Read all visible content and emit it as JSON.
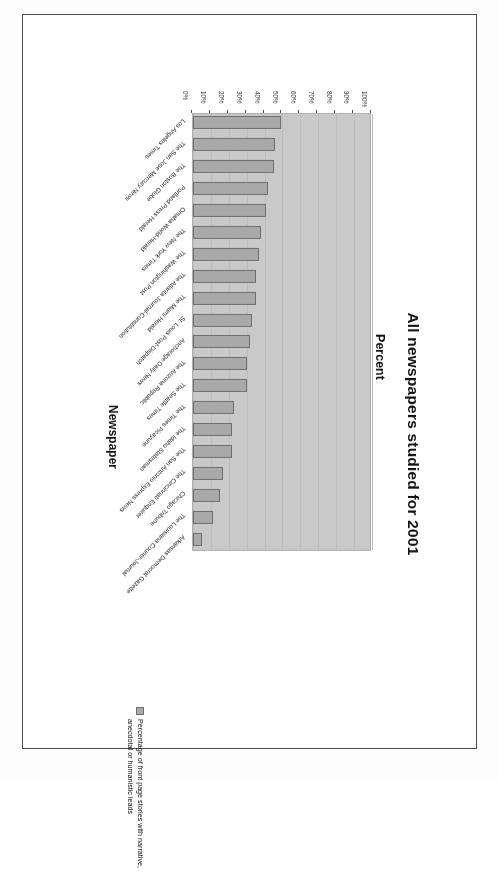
{
  "document": {
    "kind": "scanned-slide",
    "orientation_note": "chart printed upside-down on the page"
  },
  "chart_data": {
    "type": "bar",
    "orientation": "vertical",
    "title": "All newspapers studied for 2001",
    "xlabel": "Newspaper",
    "ylabel": "Percent",
    "ylim": [
      0,
      100
    ],
    "grid": true,
    "legend_position": "right",
    "legend": [
      "Percentage of front page stories with narrative, anecdotal or humanistic leads"
    ],
    "ytick_labels": [
      "100%",
      "90%",
      "80%",
      "70%",
      "60%",
      "50%",
      "40%",
      "30%",
      "20%",
      "10%",
      "0%"
    ],
    "ytick_values": [
      100,
      90,
      80,
      70,
      60,
      50,
      40,
      30,
      20,
      10,
      0
    ],
    "categories": [
      "Arkansas Democrat Gazette",
      "The Louisiana Courier-Journal",
      "Chicago Tribune",
      "The Cincinnati Enquirer",
      "The San Antonio Express News",
      "The Idaho Statesman",
      "The Times Picayune",
      "The Seattle Times",
      "The Arizona Republic",
      "Anchorage Daily News",
      "St. Louis Post-Dispatch",
      "The Miami Herald",
      "The Atlanta Journal-Constitution",
      "The Washington Post",
      "The New York Times",
      "Omaha World-Herald",
      "Portland Press Herald",
      "The Boston Globe",
      "The San Jose Mercury News",
      "Los Angeles Times"
    ],
    "values": [
      5,
      11,
      15,
      17,
      22,
      22,
      23,
      30,
      30,
      32,
      33,
      35,
      35,
      37,
      38,
      41,
      42,
      45,
      46,
      49
    ],
    "series": [
      {
        "name": "Percentage of front page stories with narrative, anecdotal or humanistic leads",
        "values": [
          5,
          11,
          15,
          17,
          22,
          22,
          23,
          30,
          30,
          32,
          33,
          35,
          35,
          37,
          38,
          41,
          42,
          45,
          46,
          49
        ]
      }
    ],
    "colors": {
      "bar_fill": "#a9a9a9",
      "bar_stroke": "#6f6f6f",
      "plot_background": "#c9c9c9",
      "gridline": "#bdbdbd",
      "text": "#111111"
    }
  }
}
